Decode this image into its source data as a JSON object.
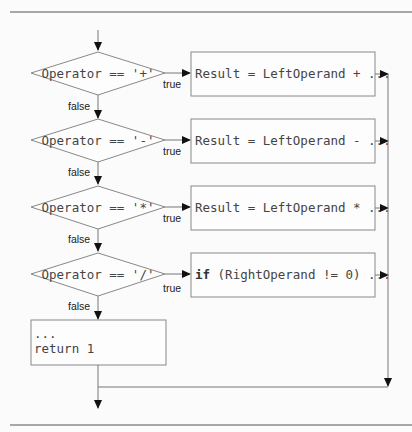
{
  "diagram": {
    "type": "flowchart",
    "decisions": [
      {
        "id": "d1",
        "text_prefix": "Operator == ",
        "operator": "'+'",
        "true_label": "true",
        "false_label": "false"
      },
      {
        "id": "d2",
        "text_prefix": "Operator == ",
        "operator": "'-'",
        "true_label": "true",
        "false_label": "false"
      },
      {
        "id": "d3",
        "text_prefix": "Operator == ",
        "operator": "'*'",
        "true_label": "true",
        "false_label": "false"
      },
      {
        "id": "d4",
        "text_prefix": "Operator == ",
        "operator": "'/'",
        "true_label": "true",
        "false_label": "false"
      }
    ],
    "actions": [
      {
        "id": "a1",
        "text": "Result = LeftOperand + ..."
      },
      {
        "id": "a2",
        "text": "Result = LeftOperand - ..."
      },
      {
        "id": "a3",
        "text": "Result = LeftOperand * ..."
      },
      {
        "id": "a4",
        "keyword": "if",
        "text": " (RightOperand != 0) ..."
      }
    ],
    "default_block": {
      "line1": "...",
      "line2": "return 1"
    }
  }
}
